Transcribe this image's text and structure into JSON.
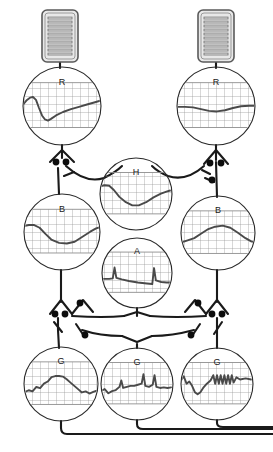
{
  "figure": {
    "title": "",
    "background_color": "#ffffff",
    "line_color": "#1a1a1a",
    "grid_color": "#8c8c8c",
    "trace_color": "#4a4a4a",
    "sensor_fill": "#e8e8e8",
    "width": 273,
    "height": 452
  },
  "sensors": [
    {
      "id": "sensor-left",
      "label": "",
      "bars": 10,
      "x": 42,
      "y": 10,
      "w": 36,
      "h": 52
    },
    {
      "id": "sensor-right",
      "label": "",
      "bars": 10,
      "x": 198,
      "y": 10,
      "w": 36,
      "h": 52
    }
  ],
  "nodes": [
    {
      "id": "node-r-left",
      "label": "R",
      "cx": 62,
      "cy": 106,
      "r": 39,
      "trace": "biphasic-dip-then-slow-rise",
      "points": "0,38 4,30 7,26 10,25 13,30 16,44 19,57 22,64 25,66 28,63 33,57 40,51 48,46 56,42 64,38 72,34 78,31 78,31"
    },
    {
      "id": "node-r-right",
      "label": "R",
      "cx": 216,
      "cy": 106,
      "r": 39,
      "trace": "shallow-sinusoid-flat",
      "points": "0,42 8,42 16,43 24,46 32,49 40,50 48,48 56,44 64,41 72,40 78,40"
    },
    {
      "id": "node-b-left",
      "label": "B",
      "cx": 62,
      "cy": 232,
      "r": 38,
      "trace": "broad-trough",
      "points": "0,30 5,28 10,28 16,33 22,44 28,54 36,60 44,61 52,58 60,49 68,40 74,34 78,32"
    },
    {
      "id": "node-b-right",
      "label": "B",
      "cx": 218,
      "cy": 233,
      "r": 37,
      "trace": "broad-peak",
      "points": "0,58 7,54 14,50 21,42 28,34 36,29 44,27 52,31 60,40 68,50 74,56 78,58"
    },
    {
      "id": "node-h",
      "label": "H",
      "cx": 136,
      "cy": 194,
      "r": 36,
      "trace": "deep-trough-recover",
      "points": "0,26 5,24 10,25 15,33 21,46 28,56 35,62 42,62 50,56 58,47 66,40 72,36 76,34"
    },
    {
      "id": "node-a",
      "label": "A",
      "cx": 137,
      "cy": 273,
      "r": 35,
      "trace": "sawtooth-spikes-decay",
      "points": "0,52 8,52 12,51 14,30 16,50 22,53 30,56 40,59 50,61 56,62 58,31 60,55 66,58 72,59 76,59"
    },
    {
      "id": "node-g-left",
      "label": "G",
      "cx": 61,
      "cy": 384,
      "r": 37,
      "trace": "noisy-burst-plateau-decay",
      "points": "0,56 5,52 9,54 13,46 17,48 21,40 25,36 29,28 33,26 37,26 41,27 45,32 49,38 53,44 57,50 61,56 65,54 69,58 73,55 76,53"
    },
    {
      "id": "node-g-mid",
      "label": "G",
      "cx": 137,
      "cy": 384,
      "r": 36,
      "trace": "spiky-irregular",
      "points": "0,54 4,50 8,58 12,54 16,52 20,46 22,34 24,48 28,46 32,44 36,44 40,42 44,40 46,22 48,44 52,46 56,42 58,24 60,46 64,48 68,47 72,48 76,47"
    },
    {
      "id": "node-g-right",
      "label": "G",
      "cx": 217,
      "cy": 384,
      "r": 36,
      "trace": "regular-oscillation-train",
      "points": "0,34 3,26 6,40 9,36 12,44 15,56 18,60 21,56 24,48 28,40 32,34 35,24 37,40 39,24 41,40 43,24 45,40 47,24 49,40 51,24 53,40 55,24 57,38 60,28 64,32 70,30 76,32"
    }
  ],
  "synapses": [
    {
      "id": "synapse-upper-left",
      "terminals": 2,
      "cx": 62,
      "cy": 152
    },
    {
      "id": "synapse-upper-right",
      "terminals": 3,
      "cx": 216,
      "cy": 152
    },
    {
      "id": "synapse-lower-left",
      "terminals": 3,
      "cx": 62,
      "cy": 312
    },
    {
      "id": "synapse-lower-right",
      "terminals": 3,
      "cx": 216,
      "cy": 312
    },
    {
      "id": "synapse-mid-left",
      "terminals": 1,
      "cx": 93,
      "cy": 330
    },
    {
      "id": "synapse-mid-right",
      "terminals": 1,
      "cx": 185,
      "cy": 330
    }
  ],
  "outputs": [
    {
      "id": "output-line-1",
      "from": "node-g-left"
    },
    {
      "id": "output-line-2",
      "from": "node-g-mid"
    },
    {
      "id": "output-line-3",
      "from": "node-g-right"
    }
  ]
}
